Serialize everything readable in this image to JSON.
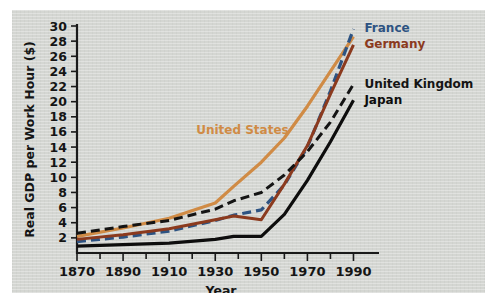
{
  "chart_data": {
    "type": "line",
    "title": "",
    "xlabel": "Year",
    "ylabel": "Real GDP per Work Hour ($)",
    "xlim": [
      1870,
      1995
    ],
    "ylim": [
      0,
      30
    ],
    "xticks": [
      1870,
      1890,
      1910,
      1930,
      1950,
      1970,
      1990
    ],
    "xtick_labels": [
      "1870",
      "1890",
      "1910",
      "1930",
      "1950",
      "1970",
      "1990"
    ],
    "xminor_ticks": [
      1880,
      1900,
      1920,
      1940,
      1960,
      1980
    ],
    "yticks": [
      2,
      4,
      6,
      8,
      10,
      12,
      14,
      16,
      18,
      20,
      22,
      24,
      26,
      28,
      30
    ],
    "ytick_labels": [
      "2",
      "4",
      "6",
      "8",
      "10",
      "12",
      "14",
      "16",
      "18",
      "20",
      "22",
      "24",
      "26",
      "28",
      "30"
    ],
    "grid": false,
    "legend_position": "inline-right",
    "series": [
      {
        "name": "United States",
        "color": "#D08B45",
        "style": "solid",
        "width": 3.2,
        "label_x": 1920,
        "label_y": 16.2,
        "label_anchor": "start",
        "x": [
          1870,
          1890,
          1910,
          1930,
          1938,
          1950,
          1960,
          1970,
          1980,
          1990
        ],
        "y": [
          2.2,
          3.3,
          4.6,
          6.6,
          8.8,
          12.0,
          15.2,
          19.4,
          24.0,
          28.6
        ]
      },
      {
        "name": "France",
        "color": "#2D5382",
        "style": "dashed",
        "width": 3.2,
        "label_x": 1993,
        "label_y": 29.8,
        "label_anchor": "start",
        "x": [
          1870,
          1890,
          1910,
          1930,
          1938,
          1950,
          1960,
          1970,
          1980,
          1990
        ],
        "y": [
          1.5,
          2.1,
          2.9,
          4.3,
          5.0,
          5.7,
          9.0,
          14.0,
          21.4,
          29.6
        ]
      },
      {
        "name": "Germany",
        "color": "#8B3A1E",
        "style": "solid",
        "width": 3.0,
        "label_x": 1993,
        "label_y": 27.6,
        "label_anchor": "start",
        "x": [
          1870,
          1890,
          1910,
          1930,
          1938,
          1950,
          1960,
          1970,
          1980,
          1990
        ],
        "y": [
          1.8,
          2.4,
          3.2,
          4.4,
          4.9,
          4.4,
          9.1,
          14.2,
          21.0,
          27.5
        ]
      },
      {
        "name": "United Kingdom",
        "color": "#141414",
        "style": "dashed",
        "width": 3.0,
        "label_x": 1993,
        "label_y": 22.4,
        "label_anchor": "start",
        "x": [
          1870,
          1890,
          1910,
          1930,
          1938,
          1950,
          1960,
          1970,
          1980,
          1990
        ],
        "y": [
          2.6,
          3.5,
          4.3,
          5.8,
          6.9,
          8.0,
          10.3,
          13.4,
          17.3,
          22.3
        ]
      },
      {
        "name": "Japan",
        "color": "#0D0D0D",
        "style": "solid",
        "width": 3.2,
        "label_x": 1993,
        "label_y": 20.2,
        "label_anchor": "start",
        "x": [
          1870,
          1890,
          1910,
          1930,
          1938,
          1950,
          1960,
          1970,
          1980,
          1990
        ],
        "y": [
          0.9,
          1.1,
          1.3,
          1.8,
          2.2,
          2.2,
          5.1,
          9.6,
          14.7,
          20.2
        ]
      }
    ]
  }
}
